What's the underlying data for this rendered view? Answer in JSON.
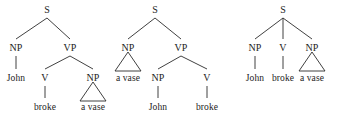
{
  "figure": {
    "background_color": "#ffffff",
    "line_color": "#2b2b2b",
    "text_color": "#1c1c1c"
  },
  "trees": [
    {
      "id": "tree-1",
      "root": "S",
      "nodes": [
        {
          "key": "s",
          "label": "S",
          "x": 47,
          "y": 10,
          "type": "nonterminal"
        },
        {
          "key": "np1",
          "label": "NP",
          "x": 16,
          "y": 48,
          "type": "nonterminal"
        },
        {
          "key": "vp",
          "label": "VP",
          "x": 70,
          "y": 48,
          "type": "nonterminal"
        },
        {
          "key": "john",
          "label": "John",
          "x": 16,
          "y": 78,
          "type": "terminal"
        },
        {
          "key": "v",
          "label": "V",
          "x": 45,
          "y": 78,
          "type": "nonterminal"
        },
        {
          "key": "np2",
          "label": "NP",
          "x": 93,
          "y": 78,
          "type": "nonterminal"
        },
        {
          "key": "broke",
          "label": "broke",
          "x": 45,
          "y": 107,
          "type": "terminal"
        },
        {
          "key": "avase",
          "label": "a vase",
          "x": 93,
          "y": 107,
          "type": "terminal"
        }
      ],
      "edges": [
        {
          "from": "s",
          "to": "np1"
        },
        {
          "from": "s",
          "to": "vp"
        },
        {
          "from": "np1",
          "to": "john"
        },
        {
          "from": "vp",
          "to": "v"
        },
        {
          "from": "vp",
          "to": "np2"
        },
        {
          "from": "v",
          "to": "broke"
        }
      ],
      "triangles": [
        {
          "apex_x": 93,
          "apex_y": 82,
          "base_y": 101,
          "half_width": 13,
          "under": "np2",
          "covers": "a vase"
        }
      ]
    },
    {
      "id": "tree-2",
      "root": "S",
      "nodes": [
        {
          "key": "s",
          "label": "S",
          "x": 155,
          "y": 10,
          "type": "nonterminal"
        },
        {
          "key": "np1",
          "label": "NP",
          "x": 128,
          "y": 48,
          "type": "nonterminal"
        },
        {
          "key": "vp",
          "label": "VP",
          "x": 181,
          "y": 48,
          "type": "nonterminal"
        },
        {
          "key": "avase",
          "label": "a vase",
          "x": 128,
          "y": 78,
          "type": "terminal"
        },
        {
          "key": "np2",
          "label": "NP",
          "x": 158,
          "y": 78,
          "type": "nonterminal"
        },
        {
          "key": "v",
          "label": "V",
          "x": 207,
          "y": 78,
          "type": "nonterminal"
        },
        {
          "key": "john",
          "label": "John",
          "x": 158,
          "y": 107,
          "type": "terminal"
        },
        {
          "key": "broke",
          "label": "broke",
          "x": 207,
          "y": 107,
          "type": "terminal"
        }
      ],
      "edges": [
        {
          "from": "s",
          "to": "np1"
        },
        {
          "from": "s",
          "to": "vp"
        },
        {
          "from": "vp",
          "to": "np2"
        },
        {
          "from": "vp",
          "to": "v"
        },
        {
          "from": "np2",
          "to": "john"
        },
        {
          "from": "v",
          "to": "broke"
        }
      ],
      "triangles": [
        {
          "apex_x": 128,
          "apex_y": 52,
          "base_y": 71,
          "half_width": 13,
          "under": "np1",
          "covers": "a vase"
        }
      ]
    },
    {
      "id": "tree-3",
      "root": "S",
      "nodes": [
        {
          "key": "s",
          "label": "S",
          "x": 283,
          "y": 10,
          "type": "nonterminal"
        },
        {
          "key": "np1",
          "label": "NP",
          "x": 255,
          "y": 48,
          "type": "nonterminal"
        },
        {
          "key": "v",
          "label": "V",
          "x": 283,
          "y": 48,
          "type": "nonterminal"
        },
        {
          "key": "np2",
          "label": "NP",
          "x": 312,
          "y": 48,
          "type": "nonterminal"
        },
        {
          "key": "john",
          "label": "John",
          "x": 255,
          "y": 78,
          "type": "terminal"
        },
        {
          "key": "broke",
          "label": "broke",
          "x": 283,
          "y": 78,
          "type": "terminal"
        },
        {
          "key": "avase",
          "label": "a vase",
          "x": 312,
          "y": 78,
          "type": "terminal"
        }
      ],
      "edges": [
        {
          "from": "s",
          "to": "np1"
        },
        {
          "from": "s",
          "to": "v"
        },
        {
          "from": "s",
          "to": "np2"
        },
        {
          "from": "np1",
          "to": "john"
        },
        {
          "from": "v",
          "to": "broke"
        }
      ],
      "triangles": [
        {
          "apex_x": 312,
          "apex_y": 52,
          "base_y": 71,
          "half_width": 13,
          "under": "np2",
          "covers": "a vase"
        }
      ]
    }
  ]
}
